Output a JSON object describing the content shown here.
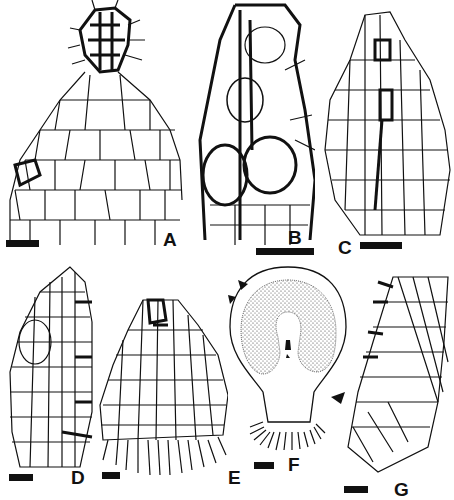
{
  "figure": {
    "panels": [
      {
        "id": "A",
        "label": "A",
        "description": "apical tissue cell network with dense dark cluster at tip",
        "scale_bar": true
      },
      {
        "id": "B",
        "label": "B",
        "description": "cell network with thick-walled central strand and large rounded cells",
        "scale_bar": true
      },
      {
        "id": "C",
        "label": "C",
        "description": "lobe-shaped cell network with thin walls",
        "scale_bar": true
      },
      {
        "id": "D",
        "label": "D",
        "description": "half-lobe cell network with darkened right margin",
        "scale_bar": true
      },
      {
        "id": "E",
        "label": "E",
        "description": "fan-shaped tissue with rhizoid-like fringe at base",
        "scale_bar": true
      },
      {
        "id": "F",
        "label": "F",
        "description": "rounded body with stippled inner layer, central cavity and basal finger-like appendages; arrowheads indicate margin",
        "scale_bar": true,
        "arrowheads": 3
      },
      {
        "id": "G",
        "label": "G",
        "description": "curved marginal cell network with darkened left edge",
        "scale_bar": true
      }
    ]
  }
}
